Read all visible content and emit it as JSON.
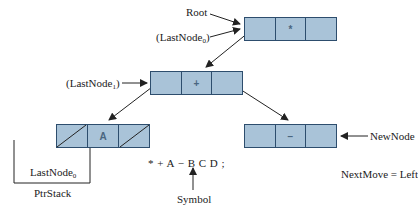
{
  "diagram": {
    "colors": {
      "node_fill": "#a9c3d8",
      "node_border": "#2d4d6d",
      "line": "#222222"
    },
    "nodes": [
      {
        "id": "root",
        "value": "*",
        "left": "pointer",
        "right": "empty"
      },
      {
        "id": "plus",
        "value": "+",
        "left": "pointer",
        "right": "pointer"
      },
      {
        "id": "a",
        "value": "A",
        "left": "null",
        "right": "null"
      },
      {
        "id": "minus",
        "value": "−",
        "left": "empty",
        "right": "empty"
      }
    ],
    "labels": {
      "root": "Root",
      "lastnode0_top": "(LastNode",
      "lastnode0_top_sub": "0",
      "lastnode0_top_close": ")",
      "lastnode1": "(LastNode",
      "lastnode1_sub": "1",
      "lastnode1_close": ")",
      "newnode": "NewNode",
      "stack_entry": "LastNode",
      "stack_entry_sub": "0",
      "ptrstack": "PtrStack",
      "expression": "* + A − B C D ;",
      "symbol": "Symbol",
      "nextmove": "NextMove = Left"
    }
  }
}
